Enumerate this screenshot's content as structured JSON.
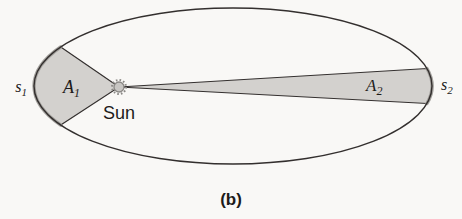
{
  "diagram": {
    "caption": "(b)",
    "sun_label": "Sun",
    "arc1": {
      "letter": "s",
      "sub": "1"
    },
    "area1": {
      "letter": "A",
      "sub": "1"
    },
    "area2": {
      "letter": "A",
      "sub": "2"
    },
    "arc2": {
      "letter": "s",
      "sub": "2"
    },
    "colors": {
      "background": "#f9f8f6",
      "shade_fill": "#d3d1ce",
      "outline": "#332f2e",
      "shade_arc": "#a3a19d",
      "sun_fill": "#c8c6c3",
      "sun_rim": "#8b8986",
      "text": "#1d1b1a"
    }
  }
}
